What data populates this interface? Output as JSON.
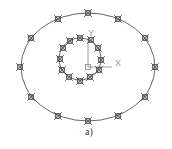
{
  "caption": "a)",
  "ucs": {
    "x_label": "X",
    "y_label": "Y",
    "origin": [
      88,
      67
    ],
    "x_end": [
      112,
      67
    ],
    "y_end": [
      88,
      38
    ]
  },
  "colors": {
    "stroke": "#555555",
    "marker": "#444444",
    "ucs": "#888888",
    "background": "#ffffff"
  },
  "outer_ellipse": {
    "cx": 88,
    "cy": 67,
    "rx": 67,
    "ry": 54
  },
  "inner_circle": {
    "cx": 80,
    "cy": 59,
    "r": 21
  },
  "outer_markers": [
    [
      88,
      13
    ],
    [
      58,
      19
    ],
    [
      118,
      19
    ],
    [
      31,
      38
    ],
    [
      145,
      38
    ],
    [
      20,
      67
    ],
    [
      155,
      67
    ],
    [
      31,
      97
    ],
    [
      145,
      97
    ],
    [
      58,
      116
    ],
    [
      118,
      116
    ],
    [
      88,
      121
    ]
  ],
  "inner_markers": [
    [
      80,
      38
    ],
    [
      70,
      41
    ],
    [
      91,
      40
    ],
    [
      63,
      48
    ],
    [
      98,
      48
    ],
    [
      60,
      59
    ],
    [
      101,
      60
    ],
    [
      62,
      70
    ],
    [
      99,
      70
    ],
    [
      69,
      77
    ],
    [
      90,
      77
    ],
    [
      80,
      81
    ]
  ]
}
